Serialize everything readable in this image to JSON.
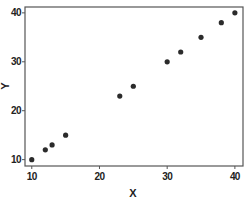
{
  "chart_data": {
    "type": "scatter",
    "title": "",
    "xlabel": "X",
    "ylabel": "Y",
    "xlim": [
      9,
      41.2
    ],
    "ylim": [
      8.7,
      41.2
    ],
    "xticks": [
      10,
      20,
      30,
      40
    ],
    "yticks": [
      10,
      20,
      30,
      40
    ],
    "xtick_labels": [
      "10",
      "20",
      "30",
      "40"
    ],
    "ytick_labels": [
      "10",
      "20",
      "30",
      "40"
    ],
    "grid": false,
    "legend": null,
    "series": [
      {
        "name": "Y vs X",
        "color": "#2b2b2b",
        "marker": "circle",
        "points": [
          {
            "x": 10,
            "y": 10
          },
          {
            "x": 12,
            "y": 12
          },
          {
            "x": 13,
            "y": 13
          },
          {
            "x": 15,
            "y": 15
          },
          {
            "x": 23,
            "y": 23
          },
          {
            "x": 25,
            "y": 25
          },
          {
            "x": 30,
            "y": 30
          },
          {
            "x": 32,
            "y": 32
          },
          {
            "x": 35,
            "y": 35
          },
          {
            "x": 38,
            "y": 38
          },
          {
            "x": 40,
            "y": 40
          }
        ]
      }
    ]
  },
  "colors": {
    "frame": "#555555",
    "marker": "#2b2b2b",
    "text": "#222222",
    "background": "#ffffff"
  }
}
